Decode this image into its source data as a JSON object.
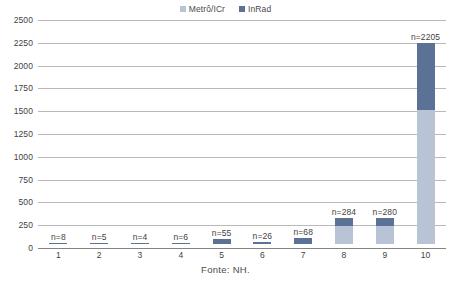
{
  "chart_data": {
    "type": "bar",
    "stacked": true,
    "title": "",
    "subtitle": "",
    "xlabel": "",
    "ylabel": "",
    "categories": [
      "1",
      "2",
      "3",
      "4",
      "5",
      "6",
      "7",
      "8",
      "9",
      "10"
    ],
    "ylim": [
      0,
      2500
    ],
    "ytick_step": 250,
    "ytick_labels": [
      "2500",
      "2250",
      "2000",
      "1750",
      "1500",
      "1250",
      "1000",
      "750",
      "500",
      "250",
      "0"
    ],
    "grid": true,
    "legend_position": "top-center",
    "series": [
      {
        "name": "Metrô/ICr",
        "color": "#b9c3d6",
        "values": [
          0,
          0,
          0,
          0,
          0,
          0,
          0,
          200,
          200,
          1470
        ]
      },
      {
        "name": "InRad",
        "color": "#5b7296",
        "values": [
          8,
          5,
          4,
          6,
          55,
          26,
          68,
          84,
          80,
          735
        ]
      }
    ],
    "totals": [
      8,
      5,
      4,
      6,
      55,
      26,
      68,
      284,
      280,
      2205
    ],
    "data_labels": [
      "n=8",
      "n=5",
      "n=4",
      "n=6",
      "n=55",
      "n=26",
      "n=68",
      "n=284",
      "n=280",
      "n=2205"
    ],
    "annotations": [
      "Fonte: NH."
    ]
  },
  "legend": {
    "items": [
      {
        "label": "Metrô/ICr",
        "color": "#b9c3d6"
      },
      {
        "label": "InRad",
        "color": "#5b7296"
      }
    ]
  },
  "source": {
    "text": "Fonte: NH."
  },
  "colors": {
    "series_light": "#b9c3d6",
    "series_dark": "#5b7296",
    "gridline": "#8e8e8e",
    "text": "#3f3f3f",
    "background": "#ffffff"
  }
}
